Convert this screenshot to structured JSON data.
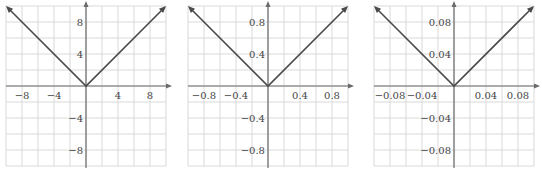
{
  "colors": {
    "grid": "#d9d9d9",
    "axis": "#6b6b6b",
    "curve": "#4a4a4a",
    "text": "#444444",
    "background": "#ffffff"
  },
  "chart_data": [
    {
      "type": "line",
      "title": "",
      "function": "y = |x|",
      "xlabel": "",
      "ylabel": "",
      "xlim": [
        -10,
        10
      ],
      "ylim": [
        -10,
        10
      ],
      "grid": true,
      "grid_step": 2,
      "x_ticks": [
        -8,
        -4,
        4,
        8
      ],
      "y_ticks": [
        8,
        4,
        -4,
        -8
      ],
      "x_tick_labels": [
        "−8",
        "−4",
        "4",
        "8"
      ],
      "y_tick_labels": [
        "8",
        "4",
        "−4",
        "−8"
      ],
      "series": [
        {
          "name": "y=|x|",
          "x": [
            -10,
            0,
            10
          ],
          "y": [
            10,
            0,
            10
          ]
        }
      ]
    },
    {
      "type": "line",
      "title": "",
      "function": "y = |x|",
      "xlabel": "",
      "ylabel": "",
      "xlim": [
        -1,
        1
      ],
      "ylim": [
        -1,
        1
      ],
      "grid": true,
      "grid_step": 0.2,
      "x_ticks": [
        -0.8,
        -0.4,
        0.4,
        0.8
      ],
      "y_ticks": [
        0.8,
        0.4,
        -0.4,
        -0.8
      ],
      "x_tick_labels": [
        "−0.8",
        "−0.4",
        "0.4",
        "0.8"
      ],
      "y_tick_labels": [
        "0.8",
        "0.4",
        "−0.4",
        "−0.8"
      ],
      "series": [
        {
          "name": "y=|x|",
          "x": [
            -1,
            0,
            1
          ],
          "y": [
            1,
            0,
            1
          ]
        }
      ]
    },
    {
      "type": "line",
      "title": "",
      "function": "y = |x|",
      "xlabel": "",
      "ylabel": "",
      "xlim": [
        -0.1,
        0.1
      ],
      "ylim": [
        -0.1,
        0.1
      ],
      "grid": true,
      "grid_step": 0.02,
      "x_ticks": [
        -0.08,
        -0.04,
        0.04,
        0.08
      ],
      "y_ticks": [
        0.08,
        0.04,
        -0.04,
        -0.08
      ],
      "x_tick_labels": [
        "−0.08",
        "−0.04",
        "0.04",
        "0.08"
      ],
      "y_tick_labels": [
        "0.08",
        "0.04",
        "−0.04",
        "−0.08"
      ],
      "series": [
        {
          "name": "y=|x|",
          "x": [
            -0.1,
            0,
            0.1
          ],
          "y": [
            0.1,
            0,
            0.1
          ]
        }
      ]
    }
  ],
  "panels": [
    {
      "x": 6,
      "y": 6,
      "size": 160,
      "label_offset_x": 0
    },
    {
      "x": 188,
      "y": 6,
      "size": 160,
      "label_offset_x": 0
    },
    {
      "x": 374,
      "y": 6,
      "size": 160,
      "label_offset_x": 0
    }
  ]
}
